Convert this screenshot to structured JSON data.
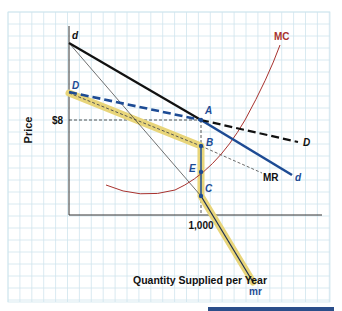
{
  "chart_data": {
    "type": "line",
    "title": "",
    "xlabel": "Quantity Supplied per Year",
    "ylabel": "Price",
    "x_ticks": [
      "1,000"
    ],
    "y_ticks": [
      "$8"
    ],
    "grid": true,
    "series": [
      {
        "name": "d",
        "style": "solid black then solid blue",
        "points": [
          [
            0,
            1.0
          ],
          [
            1000,
            8
          ],
          [
            1700,
            0.4
          ]
        ]
      },
      {
        "name": "D",
        "style": "dashed blue then dashed black",
        "points": [
          [
            0,
            0.69
          ],
          [
            1000,
            8
          ],
          [
            1700,
            0.55
          ]
        ]
      },
      {
        "name": "MR",
        "style": "thin dashed",
        "points": [
          [
            1000,
            0.45
          ],
          [
            1400,
            0.29
          ]
        ]
      },
      {
        "name": "mr",
        "style": "solid thin black with yellow highlight",
        "points": [
          [
            0,
            1.0
          ],
          [
            1000,
            0.12
          ]
        ]
      },
      {
        "name": "kinked MR (highlighted)",
        "style": "yellow highlight",
        "points": [
          [
            0,
            0.67
          ],
          [
            1000,
            0.45
          ],
          [
            1000,
            0.12
          ],
          [
            400,
            -0.43
          ]
        ]
      },
      {
        "name": "MC",
        "style": "solid red curve",
        "points": [
          [
            280,
            0.2
          ],
          [
            500,
            0.13
          ],
          [
            1000,
            0.28
          ],
          [
            1600,
            1.0
          ]
        ]
      }
    ],
    "annotations": [
      "d",
      "D",
      "A",
      "B",
      "E",
      "C",
      "MC",
      "MR",
      "d",
      "D",
      "mr",
      "$8",
      "1,000"
    ]
  },
  "labels": {
    "y_axis": "Price",
    "x_axis": "Quantity Supplied per Year",
    "price_tick": "$8",
    "qty_tick": "1,000",
    "d_top": "d",
    "D_left": "D",
    "A": "A",
    "B": "B",
    "E": "E",
    "C": "C",
    "MC": "MC",
    "MR": "MR",
    "d_right": "d",
    "D_right": "D",
    "mr": "mr"
  },
  "colors": {
    "grid": "#c9e3ec",
    "axis": "#333333",
    "demand_black": "#111111",
    "demand_blue": "#1d4b94",
    "mc": "#a8322e",
    "highlight": "#e8d57a",
    "point": "#1d4b94"
  }
}
